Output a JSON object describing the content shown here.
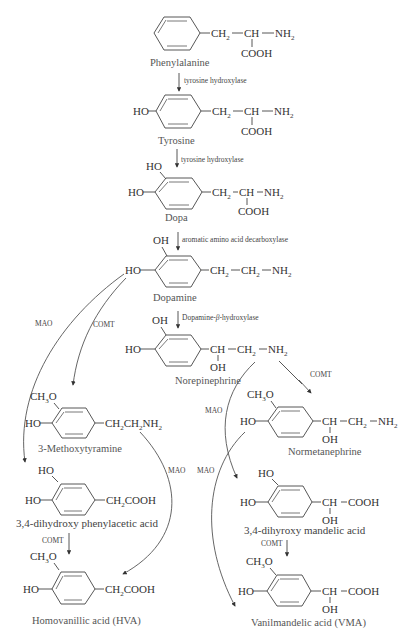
{
  "compounds": {
    "phenylalanine": {
      "name": "Phenylalanine",
      "side_chain": [
        "CH",
        "2",
        "CH",
        "NH",
        "2",
        "COOH"
      ]
    },
    "tyrosine": {
      "name": "Tyrosine",
      "substituent": "HO",
      "side_chain": [
        "CH",
        "2",
        "CH",
        "NH",
        "2",
        "COOH"
      ]
    },
    "dopa": {
      "name": "Dopa",
      "substituents": [
        "HO",
        "HO"
      ],
      "side_chain": [
        "CH",
        "2",
        "CH",
        "NH",
        "2",
        "COOH"
      ]
    },
    "dopamine": {
      "name": "Dopamine",
      "substituents": [
        "OH",
        "HO"
      ],
      "side_chain": [
        "CH",
        "2",
        "CH",
        "2",
        "NH",
        "2"
      ]
    },
    "norepinephrine": {
      "name": "Norepinephrine",
      "substituents": [
        "OH",
        "HO"
      ],
      "side_chain": [
        "CH",
        "CH",
        "2",
        "NH",
        "2",
        "OH"
      ]
    },
    "methoxytyramine": {
      "name": "3-Methoxytyramine",
      "substituents": [
        "CH",
        "3",
        "O",
        "HO"
      ],
      "side_chain": [
        "CH",
        "2",
        "CH",
        "2",
        "NH",
        "2"
      ]
    },
    "normetanephrine": {
      "name": "Normetanephrine",
      "substituents": [
        "CH",
        "3",
        "O",
        "HO"
      ],
      "side_chain": [
        "CH",
        "CH",
        "2",
        "NH",
        "2",
        "OH"
      ]
    },
    "dopac": {
      "name": "3,4-dihydroxy phenylacetic acid",
      "substituents": [
        "HO",
        "HO"
      ],
      "side_chain": [
        "CH",
        "2",
        "COOH"
      ]
    },
    "dhma": {
      "name": "3,4-dihyroxy mandelic acid",
      "substituents": [
        "HO",
        "HO"
      ],
      "side_chain": [
        "CH",
        "COOH",
        "OH"
      ]
    },
    "hva": {
      "name": "Homovanillic acid (HVA)",
      "substituents": [
        "CH",
        "3",
        "O",
        "HO"
      ],
      "side_chain": [
        "CH",
        "2",
        "COOH"
      ]
    },
    "vma": {
      "name": "Vanilmandelic acid (VMA)",
      "substituents": [
        "CH",
        "3",
        "O",
        "HO"
      ],
      "side_chain": [
        "CH",
        "COOH",
        "OH"
      ]
    }
  },
  "enzymes": {
    "phe_to_tyr": "tyrosine hydroxylase",
    "tyr_to_dopa": "tyrosine hydroxylase",
    "dopa_to_dopamine": "aromatic amino acid decarboxylase",
    "dopamine_to_ne_prefix": "Dopamine-",
    "dopamine_to_ne_beta": "β",
    "dopamine_to_ne_suffix": "-hydroxylase",
    "dopamine_mao": "MAO",
    "dopamine_comt": "COMT",
    "ne_comt": "COMT",
    "ne_mao": "MAO",
    "mt_mao": "MAO",
    "nm_mao": "MAO",
    "dopac_comt": "COMT",
    "dhma_comt": "COMT"
  }
}
